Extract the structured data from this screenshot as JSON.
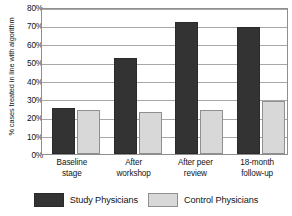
{
  "chart_data": {
    "type": "bar",
    "title": "",
    "xlabel": "",
    "ylabel": "% cases treated in line with algorithm",
    "ylim": [
      0,
      80
    ],
    "grid": true,
    "legend_position": "bottom",
    "categories": [
      "Baseline stage",
      "After workshop",
      "After peer review",
      "18-month follow-up"
    ],
    "category_lines": [
      [
        "Baseline",
        "stage"
      ],
      [
        "After",
        "workshop"
      ],
      [
        "After peer",
        "review"
      ],
      [
        "18-month",
        "follow-up"
      ]
    ],
    "ytick_labels": [
      "80%",
      "70%",
      "60%",
      "50%",
      "40%",
      "30%",
      "20%",
      "10%",
      "0%"
    ],
    "ytick_values": [
      80,
      70,
      60,
      50,
      40,
      30,
      20,
      10,
      0
    ],
    "series": [
      {
        "name": "Study Physicians",
        "color": "#333333",
        "values": [
          25,
          52,
          72,
          69
        ]
      },
      {
        "name": "Control Physicians",
        "color": "#d8d8d8",
        "values": [
          24,
          23,
          24,
          29
        ]
      }
    ]
  }
}
